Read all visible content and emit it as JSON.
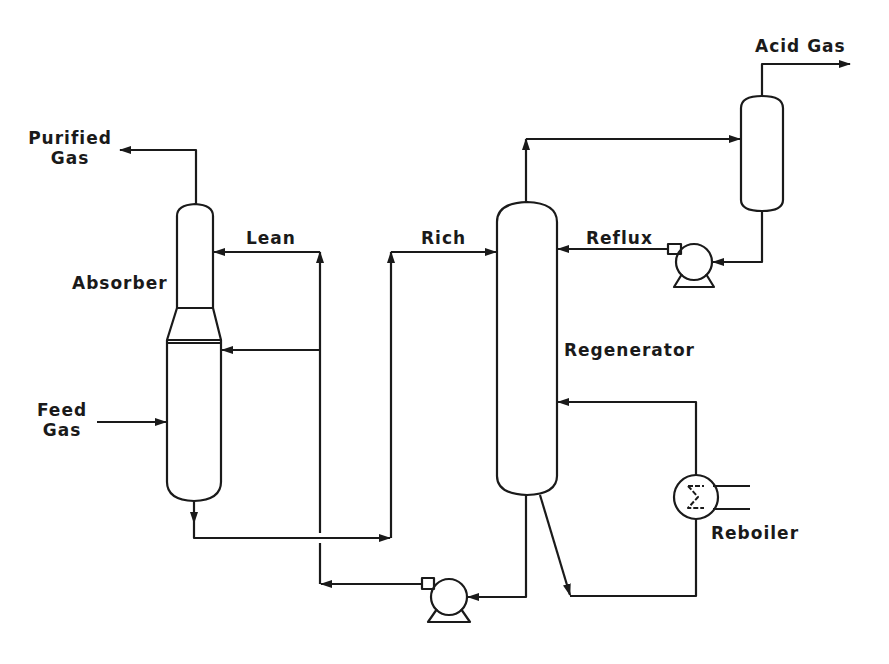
{
  "diagram": {
    "type": "process-flow",
    "colors": {
      "line": "#1a1a1a",
      "background": "#ffffff"
    }
  },
  "labels": {
    "purified_gas": "Purified\nGas",
    "purified_gas_line1": "Purified",
    "purified_gas_line2": "Gas",
    "absorber": "Absorber",
    "lean": "Lean",
    "feed_gas_line1": "Feed",
    "feed_gas_line2": "Gas",
    "rich": "Rich",
    "regenerator": "Regenerator",
    "reflux": "Reflux",
    "acid_gas": "Acid Gas",
    "reboiler": "Reboiler"
  },
  "equipment": [
    {
      "id": "absorber",
      "label": "Absorber",
      "type": "column"
    },
    {
      "id": "regenerator",
      "label": "Regenerator",
      "type": "column"
    },
    {
      "id": "reflux-drum",
      "label": "",
      "type": "vessel"
    },
    {
      "id": "reflux-pump",
      "label": "",
      "type": "pump"
    },
    {
      "id": "lean-pump",
      "label": "",
      "type": "pump"
    },
    {
      "id": "reboiler",
      "label": "Reboiler",
      "type": "heat-exchanger"
    }
  ],
  "streams": [
    {
      "from": "feed",
      "to": "absorber",
      "label": "Feed Gas"
    },
    {
      "from": "absorber",
      "to": "out",
      "label": "Purified Gas"
    },
    {
      "from": "lean-pump",
      "to": "absorber",
      "label": "Lean"
    },
    {
      "from": "absorber",
      "to": "regenerator",
      "label": "Rich"
    },
    {
      "from": "regenerator",
      "to": "reflux-drum",
      "label": ""
    },
    {
      "from": "reflux-drum",
      "to": "out",
      "label": "Acid Gas"
    },
    {
      "from": "reflux-pump",
      "to": "regenerator",
      "label": "Reflux"
    },
    {
      "from": "reboiler",
      "to": "regenerator",
      "label": ""
    }
  ]
}
